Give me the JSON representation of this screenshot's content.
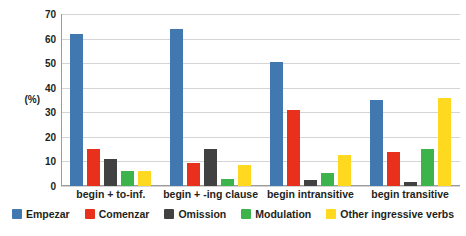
{
  "chart_data": {
    "type": "bar",
    "title": "",
    "subtitle": "",
    "xlabel": "",
    "ylabel": "(%)",
    "ylim": [
      0,
      70
    ],
    "ytick_step": 10,
    "yticks": [
      "70",
      "60",
      "50",
      "40",
      "30",
      "20",
      "10",
      "0"
    ],
    "grid": true,
    "legend_position": "bottom",
    "categories": [
      "begin + to-inf.",
      "begin + -ing clause",
      "begin intransitive",
      "begin transitive"
    ],
    "series": [
      {
        "name": "Empezar",
        "color": "#4278b0",
        "values": [
          62,
          64,
          50.5,
          35
        ]
      },
      {
        "name": "Comenzar",
        "color": "#e8301c",
        "values": [
          15,
          9.5,
          31,
          14
        ]
      },
      {
        "name": "Omission",
        "color": "#414141",
        "values": [
          11,
          15,
          2.5,
          1.5
        ]
      },
      {
        "name": "Modulation",
        "color": "#3cb44b",
        "values": [
          6,
          3,
          5.5,
          15
        ]
      },
      {
        "name": "Other ingressive verbs",
        "color": "#ffd920",
        "values": [
          6,
          8.5,
          12.5,
          36
        ]
      }
    ]
  }
}
